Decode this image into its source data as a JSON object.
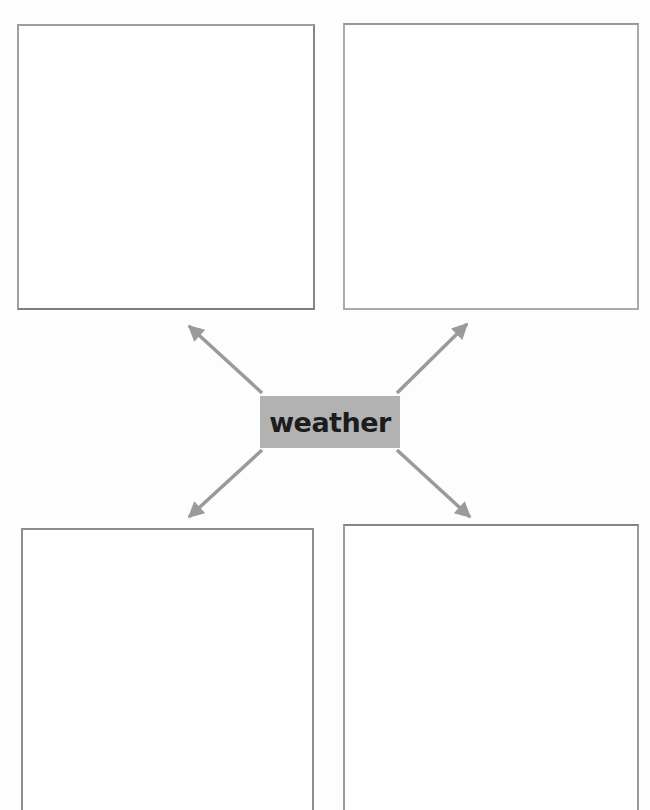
{
  "diagram": {
    "type": "mind-map-worksheet",
    "center_label": "weather",
    "boxes": [
      {
        "position": "top-left",
        "content": ""
      },
      {
        "position": "top-right",
        "content": ""
      },
      {
        "position": "bottom-left",
        "content": ""
      },
      {
        "position": "bottom-right",
        "content": ""
      }
    ],
    "icons": [
      {
        "name": "arrow-top-left-icon"
      },
      {
        "name": "arrow-top-right-icon"
      },
      {
        "name": "arrow-bottom-left-icon"
      },
      {
        "name": "arrow-bottom-right-icon"
      }
    ],
    "colors": {
      "background": "#fdfdfd",
      "center_box_bg": "#b2b2b2",
      "center_text": "#1c1c1c",
      "arrow": "#9a9a9a",
      "box_border": "#9c9c9c"
    }
  }
}
